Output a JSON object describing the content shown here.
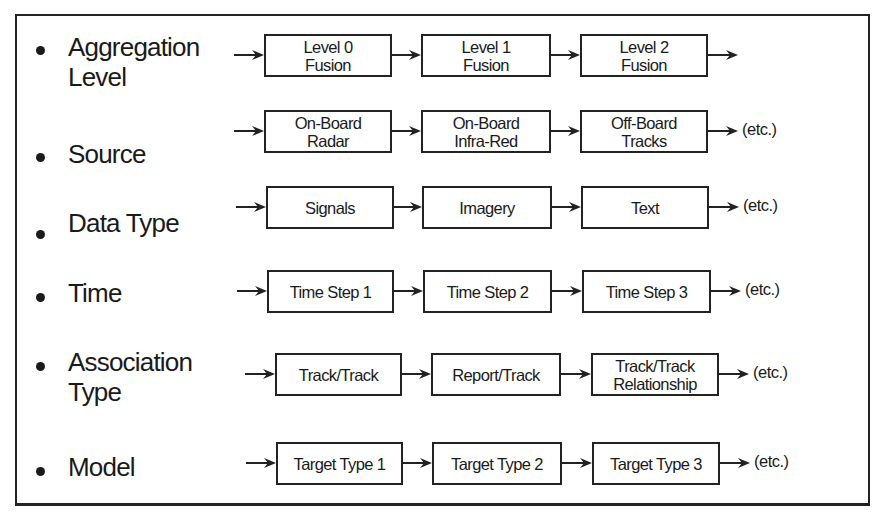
{
  "rows": [
    {
      "label_line1": "Aggregation",
      "label_line2": "Level",
      "steps": [
        "Level 0\nFusion",
        "Level 1\nFusion",
        "Level 2\nFusion"
      ],
      "trailing": ""
    },
    {
      "label_line1": "Source",
      "label_line2": "",
      "steps": [
        "On-Board\nRadar",
        "On-Board\nInfra-Red",
        "Off-Board\nTracks"
      ],
      "trailing": "(etc.)"
    },
    {
      "label_line1": "Data Type",
      "label_line2": "",
      "steps": [
        "Signals",
        "Imagery",
        "Text"
      ],
      "trailing": "(etc.)"
    },
    {
      "label_line1": "Time",
      "label_line2": "",
      "steps": [
        "Time Step 1",
        "Time Step 2",
        "Time Step 3"
      ],
      "trailing": "(etc.)"
    },
    {
      "label_line1": "Association",
      "label_line2": "Type",
      "steps": [
        "Track/Track",
        "Report/Track",
        "Track/Track\nRelationship"
      ],
      "trailing": "(etc.)"
    },
    {
      "label_line1": "Model",
      "label_line2": "",
      "steps": [
        "Target Type 1",
        "Target Type 2",
        "Target Type 3"
      ],
      "trailing": "(etc.)"
    }
  ],
  "colors": {
    "line": "#222222",
    "text": "#1a1a1a",
    "background": "#ffffff"
  }
}
